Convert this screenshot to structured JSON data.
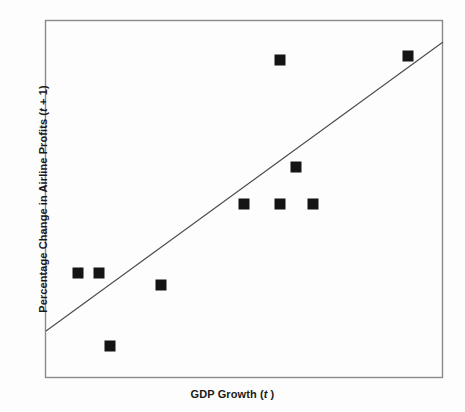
{
  "figure": {
    "background_color": "#fdfdfd",
    "frame_color": "#8a8a8a",
    "marker_color": "#141414",
    "trendline_color": "#4a4a4a"
  },
  "axes": {
    "x_title_prefix": "GDP Growth (",
    "x_title_var": "t",
    "x_title_suffix": " )",
    "y_title_prefix": "Percentage Change in Airline Profits (",
    "y_title_var": "t",
    "y_title_suffix": " + 1)"
  },
  "chart_data": {
    "type": "scatter",
    "title": "",
    "xlabel": "GDP Growth (t)",
    "ylabel": "Percentage Change in Airline Profits (t + 1)",
    "grid": false,
    "legend": false,
    "xlim": [
      0,
      100
    ],
    "ylim": [
      0,
      100
    ],
    "axis_ticks": "none",
    "marker_style": "filled-square",
    "marker_size_px": 11,
    "points": [
      {
        "x": 8.3,
        "y": 83.7
      },
      {
        "x": 13.6,
        "y": 83.7
      },
      {
        "x": 15.6,
        "y": 70.4
      },
      {
        "x": 29.2,
        "y": 85.5
      },
      {
        "x": 49.0,
        "y": 47.2
      },
      {
        "x": 58.9,
        "y": 11.2
      },
      {
        "x": 59.1,
        "y": 29.9
      },
      {
        "x": 63.1,
        "y": 47.2
      },
      {
        "x": 67.3,
        "y": 47.2
      },
      {
        "x": 91.2,
        "y": 90.0
      },
      {
        "x": 58.9,
        "y": 11.2
      }
    ],
    "points_pixel": [
      {
        "cx": 78,
        "cy": 273
      },
      {
        "cx": 99,
        "cy": 273
      },
      {
        "cx": 110,
        "cy": 346
      },
      {
        "cx": 161,
        "cy": 285
      },
      {
        "cx": 244,
        "cy": 204
      },
      {
        "cx": 280,
        "cy": 60
      },
      {
        "cx": 280,
        "cy": 204
      },
      {
        "cx": 296,
        "cy": 167
      },
      {
        "cx": 313,
        "cy": 204
      },
      {
        "cx": 408,
        "cy": 56
      }
    ],
    "trendline": {
      "visible": true,
      "from_pixel": {
        "x": 46,
        "y": 331
      },
      "to_pixel": {
        "x": 443,
        "y": 42
      }
    },
    "frame_pixel": {
      "left": 45,
      "top": 20,
      "right": 443,
      "bottom": 378
    }
  }
}
